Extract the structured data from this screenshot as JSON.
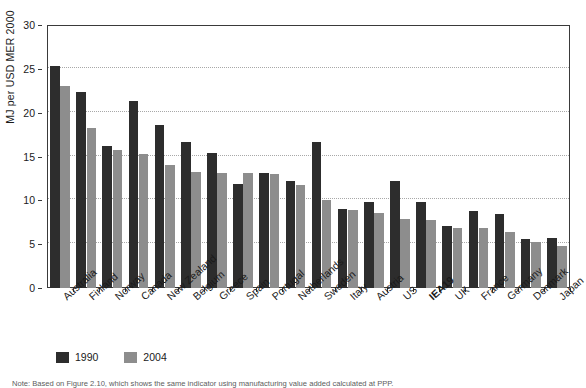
{
  "chart_data": {
    "type": "bar",
    "title": "",
    "xlabel": "",
    "ylabel": "MJ per USD MER 2000",
    "ylim": [
      0,
      30
    ],
    "yticks": [
      0,
      5,
      10,
      15,
      20,
      25,
      30
    ],
    "ytick_labels": [
      "0",
      "5",
      "10",
      "15",
      "20",
      "25",
      "30"
    ],
    "grid": true,
    "grid_axis": "y",
    "legend_position": "bottom-left",
    "categories": [
      "Australia",
      "Finland",
      "Norway",
      "Canada",
      "New Zealand",
      "Belgium",
      "Greece",
      "Spain",
      "Portugal",
      "Netherlands",
      "Sweden",
      "Italy",
      "Austria",
      "US",
      "IEA19",
      "UK",
      "France",
      "Germany",
      "Denmark",
      "Japan"
    ],
    "emphasized_categories": [
      "IEA19"
    ],
    "series": [
      {
        "name": "1990",
        "color": "#2d2d2d",
        "values": [
          25.3,
          22.4,
          16.2,
          21.3,
          18.6,
          16.6,
          15.4,
          11.9,
          13.1,
          12.2,
          16.6,
          9.0,
          9.8,
          12.2,
          9.8,
          7.1,
          8.8,
          8.4,
          5.6,
          5.7
        ]
      },
      {
        "name": "2004",
        "color": "#8d8d8d",
        "values": [
          23.1,
          18.3,
          15.7,
          15.3,
          14.0,
          13.2,
          13.1,
          13.1,
          13.0,
          11.8,
          10.0,
          8.9,
          8.6,
          7.9,
          7.8,
          6.9,
          6.8,
          6.4,
          5.2,
          4.8
        ]
      }
    ]
  },
  "footnote": {
    "text": "Note: Based on Figure 2.10, which shows the same indicator using manufacturing value added calculated at PPP."
  }
}
